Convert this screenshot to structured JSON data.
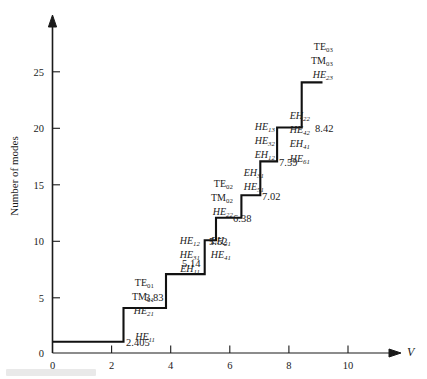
{
  "figure": {
    "type": "step-chart",
    "xlabel": "V",
    "ylabel": "Number of modes"
  },
  "axes": {
    "x_ticks": [
      "0",
      "2",
      "4",
      "6",
      "8",
      "10"
    ],
    "y_ticks": [
      "5",
      "10",
      "15",
      "20",
      "25"
    ],
    "y_origin_label": "0",
    "xlim": [
      0,
      11.4
    ],
    "ylim": [
      0,
      28
    ]
  },
  "chart_data": {
    "type": "line",
    "subtype": "step",
    "title": "",
    "xlabel": "V",
    "ylabel": "Number of modes",
    "xlim": [
      0,
      11.4
    ],
    "ylim": [
      0,
      28
    ],
    "grid": false,
    "legend": "none",
    "x_ticks": [
      0,
      2,
      4,
      6,
      8,
      10
    ],
    "y_ticks": [
      0,
      5,
      10,
      15,
      20,
      25
    ],
    "cutoff_V": [
      2.405,
      3.83,
      5.14,
      5.52,
      6.38,
      7.02,
      7.59,
      8.42
    ],
    "mode_counts": [
      1,
      4,
      7,
      10,
      12,
      14,
      17,
      20,
      24
    ],
    "series": [
      {
        "name": "Number of guided modes",
        "x": [
          0,
          2.405,
          2.405,
          3.83,
          3.83,
          5.14,
          5.14,
          5.52,
          5.52,
          6.38,
          6.38,
          7.02,
          7.02,
          7.59,
          7.59,
          8.42,
          8.42,
          9.12
        ],
        "values": [
          1,
          1,
          4,
          4,
          7,
          7,
          10,
          10,
          12,
          12,
          14,
          14,
          17,
          17,
          20,
          20,
          24,
          24
        ]
      }
    ],
    "annotations": [
      {
        "v_label": "2.405",
        "v_value": 2.405,
        "modes_after": 4,
        "mode_labels": [
          {
            "text": "HE",
            "sub": "11",
            "style": "italic"
          }
        ]
      },
      {
        "v_label": "3.83",
        "v_value": 3.83,
        "modes_after": 7,
        "mode_labels": [
          {
            "text": "TE",
            "sub": "01",
            "style": "roman"
          },
          {
            "text": "TM",
            "sub": "01",
            "style": "roman"
          },
          {
            "text": "HE",
            "sub": "21",
            "style": "italic"
          }
        ]
      },
      {
        "v_label": "5.14",
        "v_value": 5.14,
        "modes_after": 10,
        "mode_labels": [
          {
            "text": "HE",
            "sub": "12",
            "style": "italic"
          },
          {
            "text": "HE",
            "sub": "31",
            "style": "italic"
          },
          {
            "text": "EH",
            "sub": "11",
            "style": "italic"
          }
        ]
      },
      {
        "v_label": "5.52",
        "v_value": 5.52,
        "modes_after": 12,
        "mode_labels": [
          {
            "text": "EH",
            "sub": "21",
            "style": "italic"
          },
          {
            "text": "HE",
            "sub": "41",
            "style": "italic"
          }
        ]
      },
      {
        "v_label": "6.38",
        "v_value": 6.38,
        "modes_after": 14,
        "mode_labels": [
          {
            "text": "TE",
            "sub": "02",
            "style": "roman"
          },
          {
            "text": "TM",
            "sub": "02",
            "style": "roman"
          },
          {
            "text": "HE",
            "sub": "22",
            "style": "italic"
          }
        ]
      },
      {
        "v_label": "7.02",
        "v_value": 7.02,
        "modes_after": 17,
        "mode_labels": [
          {
            "text": "EH",
            "sub": "31",
            "style": "italic"
          },
          {
            "text": "HE",
            "sub": "51",
            "style": "italic"
          }
        ]
      },
      {
        "v_label": "7.59",
        "v_value": 7.59,
        "modes_after": 20,
        "mode_labels": [
          {
            "text": "HE",
            "sub": "13",
            "style": "italic"
          },
          {
            "text": "HE",
            "sub": "32",
            "style": "italic"
          },
          {
            "text": "EH",
            "sub": "12",
            "style": "italic"
          }
        ]
      },
      {
        "v_label": "8.42",
        "v_value": 8.42,
        "modes_after": 24,
        "mode_labels": [
          {
            "text": "EH",
            "sub": "22",
            "style": "italic"
          },
          {
            "text": "HE",
            "sub": "42",
            "style": "italic"
          },
          {
            "text": "EH",
            "sub": "41",
            "style": "italic"
          },
          {
            "text": "HE",
            "sub": "61",
            "style": "italic"
          }
        ]
      },
      {
        "v_label": "",
        "v_value": null,
        "modes_after": 24,
        "mode_labels": [
          {
            "text": "TE",
            "sub": "03",
            "style": "roman"
          },
          {
            "text": "TM",
            "sub": "03",
            "style": "roman"
          },
          {
            "text": "HE",
            "sub": "23",
            "style": "italic"
          }
        ]
      }
    ]
  },
  "label_positions": {
    "groups": [
      {
        "id": "g-he11",
        "right": 155,
        "top": 331,
        "ann": 0
      },
      {
        "id": "g-383",
        "right": 154,
        "top": 277,
        "ann": 1
      },
      {
        "id": "g-514",
        "right": 200,
        "top": 235,
        "ann": 2
      },
      {
        "id": "g-552",
        "right": 231,
        "top": 235,
        "ann": 3
      },
      {
        "id": "g-638",
        "right": 233,
        "top": 178,
        "ann": 4
      },
      {
        "id": "g-702",
        "right": 264,
        "top": 167,
        "ann": 5
      },
      {
        "id": "g-759",
        "right": 275,
        "top": 121,
        "ann": 6
      },
      {
        "id": "g-842a",
        "right": 310,
        "top": 110,
        "ann": 7
      },
      {
        "id": "g-te03",
        "right": 333,
        "top": 41,
        "ann": 8
      }
    ],
    "vnums": [
      {
        "id": "v-2405",
        "left": 126,
        "top": 337,
        "ann": 0
      },
      {
        "id": "v-383",
        "left": 145,
        "top": 292,
        "ann": 1
      },
      {
        "id": "v-514",
        "left": 182,
        "top": 258,
        "ann": 2
      },
      {
        "id": "v-552",
        "left": 209,
        "top": 236,
        "ann": 3
      },
      {
        "id": "v-638",
        "left": 233,
        "top": 213,
        "ann": 4
      },
      {
        "id": "v-702",
        "left": 262,
        "top": 191,
        "ann": 5
      },
      {
        "id": "v-759",
        "left": 279,
        "top": 157,
        "ann": 6
      },
      {
        "id": "v-842",
        "left": 315,
        "top": 123,
        "ann": 7
      }
    ]
  }
}
